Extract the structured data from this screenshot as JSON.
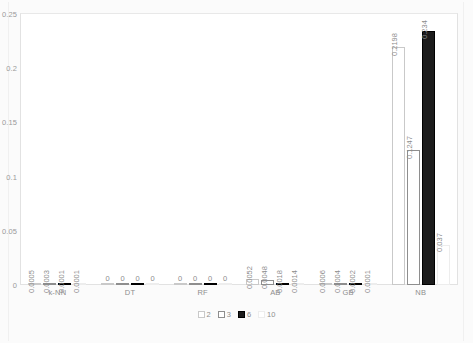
{
  "chart_data": {
    "type": "bar",
    "title": "",
    "xlabel": "",
    "ylabel": "",
    "ylim": [
      0,
      0.25
    ],
    "ytick_labels": [
      "0.25",
      "0.2",
      "0.15",
      "0.1",
      "0.05",
      "0"
    ],
    "ytick_values": [
      0.25,
      0.2,
      0.15,
      0.1,
      0.05,
      0
    ],
    "grid": false,
    "legend_position": "bottom",
    "categories": [
      "k-NN",
      "DT",
      "RF",
      "AB",
      "GB",
      "NB"
    ],
    "series": [
      {
        "name": "2",
        "values": [
          0.0005,
          0,
          0,
          0.0052,
          0.0006,
          0.2198
        ],
        "labels": [
          "0.0005",
          "0",
          "0",
          "0.0052",
          "0.0006",
          "0.2198"
        ],
        "color": "#ffffff",
        "border_color": "#c9c9c9"
      },
      {
        "name": "3",
        "values": [
          0.0003,
          0,
          0,
          0.0048,
          0.0004,
          0.1247
        ],
        "labels": [
          "0.0003",
          "0",
          "0",
          "0.0048",
          "0.0004",
          "0.1247"
        ],
        "color": "#ffffff",
        "border_color": "#8e8e8e"
      },
      {
        "name": "6",
        "values": [
          0.0001,
          0,
          0,
          0.0018,
          0.0002,
          0.234
        ],
        "labels": [
          "0.0001",
          "0",
          "0",
          "0.0018",
          "0.0002",
          "0.234"
        ],
        "color": "#1c1c1c",
        "border_color": "#000000"
      },
      {
        "name": "10",
        "values": [
          0.0001,
          0,
          0,
          0.0014,
          0.0001,
          0.037
        ],
        "labels": [
          "0.0001",
          "0",
          "0",
          "0.0014",
          "0.0001",
          "0.037"
        ],
        "color": "#ffffff",
        "border_color": "#ededed"
      }
    ]
  }
}
